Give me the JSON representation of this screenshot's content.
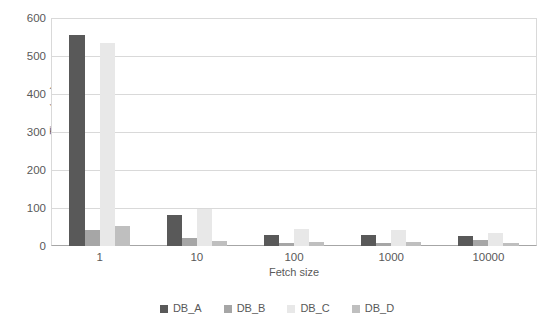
{
  "chart_data": {
    "type": "bar",
    "title": "",
    "subtitle": "",
    "xlabel": "Fetch size",
    "ylabel": "Time (ms)",
    "categories": [
      "1",
      "10",
      "100",
      "1000",
      "10000"
    ],
    "series": [
      {
        "name": "DB_A",
        "color": "#595959",
        "values": [
          555,
          82,
          30,
          28,
          26
        ]
      },
      {
        "name": "DB_B",
        "color": "#a6a6a6",
        "values": [
          42,
          22,
          9,
          8,
          16
        ]
      },
      {
        "name": "DB_C",
        "color": "#e8e8e8",
        "values": [
          535,
          97,
          44,
          42,
          34
        ]
      },
      {
        "name": "DB_D",
        "color": "#bfbfbf",
        "values": [
          52,
          14,
          11,
          10,
          8
        ]
      }
    ],
    "ylim": [
      0,
      600
    ],
    "yticks": [
      0,
      100,
      200,
      300,
      400,
      500,
      600
    ],
    "ytick_labels": [
      "0",
      "100",
      "200",
      "300",
      "400",
      "500",
      "600"
    ],
    "grid": true,
    "grid_axis": "y",
    "legend_position": "bottom",
    "bar_orientation": "vertical",
    "background_color": "#ffffff",
    "axis_color": "#a6a6a6",
    "gridline_color": "#d9d9d9",
    "text_color": "#595959"
  },
  "legend": {
    "items": [
      {
        "label": "DB_A",
        "color": "#595959"
      },
      {
        "label": "DB_B",
        "color": "#a6a6a6"
      },
      {
        "label": "DB_C",
        "color": "#e8e8e8"
      },
      {
        "label": "DB_D",
        "color": "#bfbfbf"
      }
    ]
  }
}
